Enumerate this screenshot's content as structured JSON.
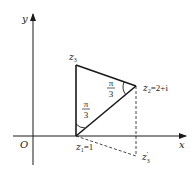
{
  "diagram": {
    "axes": {
      "x_label": "x",
      "y_label": "y",
      "origin_label": "O"
    },
    "points": {
      "z1": {
        "name": "z",
        "sub": "1",
        "suffix": "=1"
      },
      "z2": {
        "name": "z",
        "sub": "2",
        "suffix": "=2+i"
      },
      "z3": {
        "name": "z",
        "sub": "3"
      },
      "z3p": {
        "name": "z",
        "sub": "3",
        "prime": "′"
      }
    },
    "angles": [
      {
        "at": "z2",
        "num": "π",
        "den": "3"
      },
      {
        "at": "z1",
        "num": "π",
        "den": "3"
      }
    ],
    "colors": {
      "stroke": "#1a1a1a",
      "background": "#ffffff"
    }
  }
}
